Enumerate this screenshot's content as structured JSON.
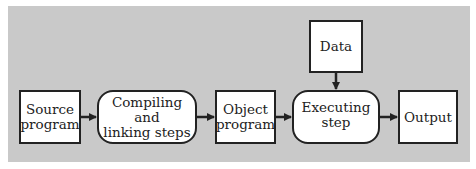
{
  "diagram": {
    "title": "",
    "background_color": "#c9c9c9",
    "nodes": [
      {
        "id": "source",
        "label_line1": "Source",
        "label_line2": "program",
        "shape": "rect"
      },
      {
        "id": "compile",
        "label_line1": "Compiling and",
        "label_line2": "linking steps",
        "shape": "rounded"
      },
      {
        "id": "object",
        "label_line1": "Object",
        "label_line2": "program",
        "shape": "rect"
      },
      {
        "id": "execute",
        "label_line1": "Executing",
        "label_line2": "step",
        "shape": "rounded"
      },
      {
        "id": "output",
        "label_line1": "Output",
        "label_line2": "",
        "shape": "rect"
      },
      {
        "id": "data",
        "label_line1": "Data",
        "label_line2": "",
        "shape": "rect"
      }
    ],
    "edges": [
      {
        "from": "source",
        "to": "compile"
      },
      {
        "from": "compile",
        "to": "object"
      },
      {
        "from": "object",
        "to": "execute"
      },
      {
        "from": "data",
        "to": "execute"
      },
      {
        "from": "execute",
        "to": "output"
      }
    ]
  }
}
